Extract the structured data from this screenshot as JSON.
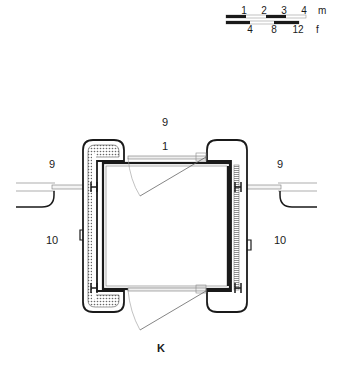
{
  "scale_bar": {
    "metric": {
      "ticks": [
        "1",
        "2",
        "3",
        "4"
      ],
      "unit": "m"
    },
    "imperial": {
      "ticks": [
        "4",
        "8",
        "12"
      ],
      "unit": "f"
    }
  },
  "labels": {
    "room_top": "9",
    "door_top": "1",
    "room_left_upper": "9",
    "room_right_upper": "9",
    "room_left_lower": "10",
    "room_right_lower": "10",
    "bottom": "K"
  },
  "colors": {
    "line": "#1a1a1a",
    "thin_line": "#555555",
    "hatch": "#888888",
    "background": "#ffffff"
  }
}
